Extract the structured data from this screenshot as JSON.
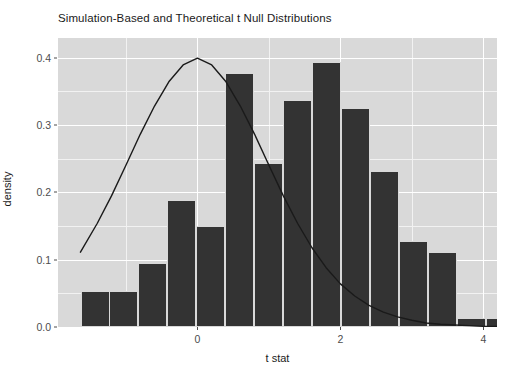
{
  "chart_data": {
    "type": "bar",
    "title": "Simulation-Based and Theoretical t Null Distributions",
    "xlabel": "t stat",
    "ylabel": "density",
    "xlim": [
      -1.95,
      4.19
    ],
    "ylim": [
      0.0,
      0.429
    ],
    "grid": true,
    "legend": "none",
    "x_ticks": [
      {
        "value": 0,
        "label": "0"
      },
      {
        "value": 2,
        "label": "2"
      },
      {
        "value": 4,
        "label": "4"
      }
    ],
    "y_ticks": [
      {
        "value": 0.0,
        "label": "0.0"
      },
      {
        "value": 0.1,
        "label": "0.1"
      },
      {
        "value": 0.2,
        "label": "0.2"
      },
      {
        "value": 0.3,
        "label": "0.3"
      },
      {
        "value": 0.4,
        "label": "0.4"
      }
    ],
    "bar_color": "#333333",
    "panel_color": "#d9d9d9",
    "gridline_color": "#ffffff",
    "curve_color": "#1a1a1a",
    "bin_width": 0.405,
    "bins": [
      {
        "x0": -1.636,
        "x1": -1.231,
        "density": 0.053
      },
      {
        "x0": -1.231,
        "x1": -0.825,
        "density": 0.053
      },
      {
        "x0": -0.825,
        "x1": -0.42,
        "density": 0.095
      },
      {
        "x0": -0.42,
        "x1": -0.014,
        "density": 0.189
      },
      {
        "x0": -0.014,
        "x1": 0.391,
        "density": 0.15
      },
      {
        "x0": 0.391,
        "x1": 0.797,
        "density": 0.377
      },
      {
        "x0": 0.797,
        "x1": 1.202,
        "density": 0.244
      },
      {
        "x0": 1.202,
        "x1": 1.608,
        "density": 0.337
      },
      {
        "x0": 1.608,
        "x1": 2.013,
        "density": 0.393
      },
      {
        "x0": 2.013,
        "x1": 2.419,
        "density": 0.325
      },
      {
        "x0": 2.419,
        "x1": 2.824,
        "density": 0.231
      },
      {
        "x0": 2.824,
        "x1": 3.23,
        "density": 0.127
      },
      {
        "x0": 3.23,
        "x1": 3.635,
        "density": 0.112
      },
      {
        "x0": 3.635,
        "x1": 4.041,
        "density": 0.014
      },
      {
        "x0": 4.041,
        "x1": 4.446,
        "density": 0.014
      }
    ],
    "theoretical_curve": {
      "name": "t null distribution",
      "description": "theoretical t density curve peaking at 0.40 at t = 0",
      "points": [
        {
          "x": -1.636,
          "y": 0.111
        },
        {
          "x": -1.4,
          "y": 0.154
        },
        {
          "x": -1.2,
          "y": 0.195
        },
        {
          "x": -1.0,
          "y": 0.24
        },
        {
          "x": -0.8,
          "y": 0.286
        },
        {
          "x": -0.6,
          "y": 0.328
        },
        {
          "x": -0.4,
          "y": 0.364
        },
        {
          "x": -0.2,
          "y": 0.389
        },
        {
          "x": 0.0,
          "y": 0.399
        },
        {
          "x": 0.2,
          "y": 0.389
        },
        {
          "x": 0.4,
          "y": 0.364
        },
        {
          "x": 0.6,
          "y": 0.328
        },
        {
          "x": 0.8,
          "y": 0.286
        },
        {
          "x": 1.0,
          "y": 0.24
        },
        {
          "x": 1.2,
          "y": 0.195
        },
        {
          "x": 1.4,
          "y": 0.154
        },
        {
          "x": 1.6,
          "y": 0.118
        },
        {
          "x": 1.8,
          "y": 0.088
        },
        {
          "x": 2.0,
          "y": 0.064
        },
        {
          "x": 2.2,
          "y": 0.046
        },
        {
          "x": 2.4,
          "y": 0.032
        },
        {
          "x": 2.6,
          "y": 0.022
        },
        {
          "x": 2.8,
          "y": 0.015
        },
        {
          "x": 3.0,
          "y": 0.01
        },
        {
          "x": 3.2,
          "y": 0.006
        },
        {
          "x": 3.4,
          "y": 0.004
        },
        {
          "x": 3.6,
          "y": 0.003
        },
        {
          "x": 3.8,
          "y": 0.002
        },
        {
          "x": 4.0,
          "y": 0.001
        },
        {
          "x": 4.19,
          "y": 0.001
        }
      ]
    }
  }
}
